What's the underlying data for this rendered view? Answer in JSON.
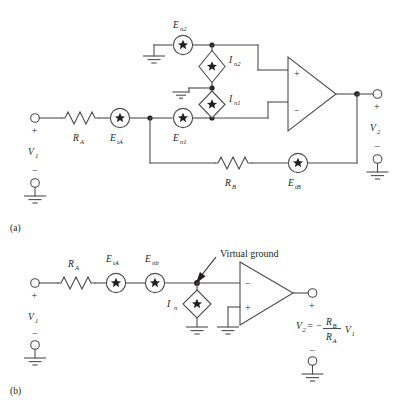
{
  "figure": {
    "background_color": "#ffffff",
    "line_color": "#4d4d4f",
    "text_color": "#231f20"
  },
  "panels": [
    {
      "id": "a",
      "caption": "(a)",
      "description": "Full noise model with all noise sources",
      "labels": {
        "input_source": "V",
        "input_source_sub": "1",
        "input_plus": "+",
        "input_minus": "−",
        "resistor_a": "R",
        "resistor_a_sub": "A",
        "thermal_a": "E",
        "thermal_a_sub": "tA",
        "noise_e1": "E",
        "noise_e1_sub": "n1",
        "noise_e2": "E",
        "noise_e2_sub": "n2",
        "noise_i1": "I",
        "noise_i1_sub": "n1",
        "noise_i2": "I",
        "noise_i2_sub": "n2",
        "resistor_b": "R",
        "resistor_b_sub": "B",
        "thermal_b": "E",
        "thermal_b_sub": "tB",
        "output_source": "V",
        "output_source_sub": "2",
        "output_plus": "+",
        "output_minus": "−",
        "opamp_noninv": "+",
        "opamp_inv": "−"
      }
    },
    {
      "id": "b",
      "caption": "(b)",
      "description": "Simplified equivalent noise model with virtual ground",
      "labels": {
        "input_source": "V",
        "input_source_sub": "1",
        "input_plus": "+",
        "input_minus": "−",
        "resistor_a": "R",
        "resistor_a_sub": "A",
        "thermal_a": "E",
        "thermal_a_sub": "tA",
        "noise_enb": "E",
        "noise_enb_sub": "nb",
        "noise_in": "I",
        "noise_in_sub": "n",
        "virtual_ground": "Virtual ground",
        "opamp_inv": "−",
        "opamp_noninv": "+",
        "output_plus": "+",
        "output_minus": "−",
        "output_eq_v2": "V",
        "output_eq_v2_sub": "2",
        "output_eq_equals": "= −",
        "output_eq_num": "R",
        "output_eq_num_sub": "B",
        "output_eq_den": "R",
        "output_eq_den_sub": "A",
        "output_eq_v1": "V",
        "output_eq_v1_sub": "1"
      }
    }
  ],
  "symbols": {
    "voltage_noise_source": "circle-with-star",
    "current_noise_source": "diamond-with-star",
    "resistor": "zigzag",
    "ground": "ground-symbol",
    "terminal": "open-circle",
    "junction": "filled-dot",
    "opamp": "triangle"
  }
}
